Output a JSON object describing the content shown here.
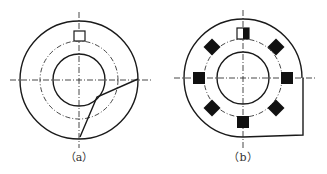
{
  "figure": {
    "panels": [
      {
        "id": "a",
        "caption": "（a）",
        "center": [
          79,
          80
        ],
        "outer_radius": 59,
        "pitch_radius": 39,
        "inner_radius": 26,
        "slot": {
          "x": 74,
          "y": 31,
          "w": 11,
          "h": 10,
          "fill": "none"
        },
        "cut_line": [
          [
            138,
            79
          ],
          [
            97,
            97
          ],
          [
            80,
            137
          ]
        ]
      },
      {
        "id": "b",
        "caption": "（b）",
        "center": [
          243,
          78
        ],
        "outer_radius": 59,
        "pitch_radius": 39,
        "inner_radius": 26,
        "corner": {
          "right_x": 303,
          "bottom_y": 135
        },
        "top_marker": {
          "x": 237,
          "y": 28,
          "w": 12,
          "h": 11,
          "half_filled": true
        },
        "square_markers": [
          [
            199,
            78
          ],
          [
            287,
            78
          ],
          [
            243,
            122
          ]
        ],
        "diamond_markers": [
          [
            212,
            47
          ],
          [
            276,
            47
          ],
          [
            212,
            108
          ],
          [
            276,
            108
          ]
        ]
      }
    ]
  },
  "colors": {
    "line": "#1a1a1a",
    "fill": "#111111",
    "background": "#ffffff"
  }
}
